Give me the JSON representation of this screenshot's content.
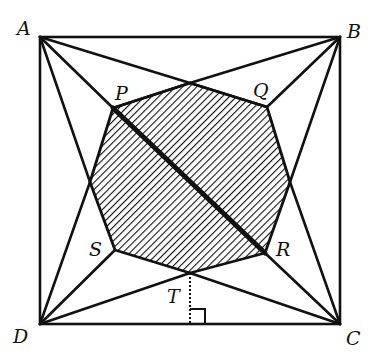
{
  "figure": {
    "points": {
      "A": {
        "x": 40,
        "y": 37
      },
      "B": {
        "x": 340,
        "y": 37
      },
      "C": {
        "x": 340,
        "y": 324
      },
      "D": {
        "x": 40,
        "y": 324
      },
      "P": {
        "x": 113,
        "y": 108
      },
      "Q": {
        "x": 267,
        "y": 107
      },
      "R": {
        "x": 265,
        "y": 253
      },
      "S": {
        "x": 115,
        "y": 250
      },
      "top": {
        "x": 190,
        "y": 83
      },
      "T": {
        "x": 190,
        "y": 273
      },
      "left": {
        "x": 90,
        "y": 182
      },
      "right": {
        "x": 290,
        "y": 182
      },
      "foot": {
        "x": 190,
        "y": 324
      }
    },
    "labels": {
      "A": "A",
      "B": "B",
      "C": "C",
      "D": "D",
      "P": "P",
      "Q": "Q",
      "R": "R",
      "S": "S",
      "T": "T"
    },
    "colors": {
      "stroke": "#111111",
      "background": "#ffffff",
      "hatch": "#111111"
    }
  }
}
